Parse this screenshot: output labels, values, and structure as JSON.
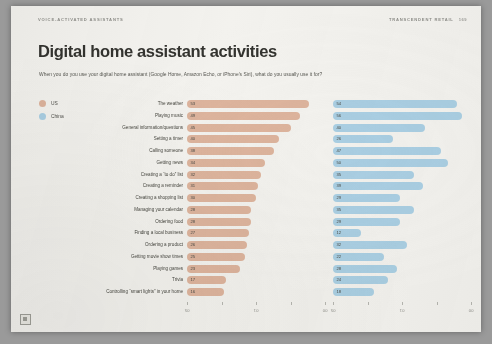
{
  "header": {
    "kicker": "VOICE-ACTIVATED ASSISTANTS",
    "brand": "TRANSCENDENT RETAIL",
    "page": "169"
  },
  "title": "Digital home assistant activities",
  "subtitle": "When you do you use your digital home assistant (Google Home, Amazon Echo, or iPhone's Siri), what do you usually use it for?",
  "legend": {
    "items": [
      {
        "label": "US",
        "color": "#ddb49d"
      },
      {
        "label": "China",
        "color": "#aacfe3"
      }
    ]
  },
  "axis": {
    "tick_labels": [
      "05",
      "",
      "01",
      "",
      "00"
    ]
  },
  "corner_mark": "page-corner-mark",
  "chart_data": {
    "type": "bar",
    "title": "Digital home assistant activities",
    "subtitle": "When you do you use your digital home assistant (Google Home, Amazon Echo, or iPhone's Siri), what do you usually use it for?",
    "xlabel": "",
    "ylabel": "",
    "xlim": [
      0,
      60
    ],
    "grid": false,
    "legend_position": "left",
    "orientation": "horizontal",
    "panels": [
      "US",
      "China"
    ],
    "categories": [
      "The weather",
      "Playing music",
      "General information/questions",
      "Setting a timer",
      "Calling someone",
      "Getting news",
      "Creating a “to do” list",
      "Creating a reminder",
      "Creating a shopping list",
      "Managing your calendar",
      "Ordering food",
      "Finding a local business",
      "Ordering a product",
      "Getting movie show times",
      "Playing games",
      "Trivia",
      "Controlling “smart lights” in your home"
    ],
    "series": [
      {
        "name": "US",
        "color": "#ddb49d",
        "values": [
          53,
          49,
          45,
          40,
          38,
          34,
          32,
          31,
          30,
          28,
          28,
          27,
          26,
          25,
          23,
          17,
          16
        ]
      },
      {
        "name": "China",
        "color": "#aacfe3",
        "values": [
          54,
          56,
          40,
          26,
          47,
          50,
          35,
          39,
          29,
          35,
          29,
          12,
          32,
          22,
          28,
          24,
          18
        ]
      }
    ]
  }
}
